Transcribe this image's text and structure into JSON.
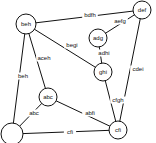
{
  "diagram": {
    "type": "graph",
    "nodes": [
      {
        "id": "beh",
        "label": "beh",
        "x": 26,
        "y": 24,
        "r": 10
      },
      {
        "id": "def",
        "label": "def",
        "x": 142,
        "y": 10,
        "r": 9
      },
      {
        "id": "adg",
        "label": "adg",
        "x": 98,
        "y": 38,
        "r": 9
      },
      {
        "id": "ghi",
        "label": "ghi",
        "x": 103,
        "y": 72,
        "r": 9
      },
      {
        "id": "abc",
        "label": "abc",
        "x": 48,
        "y": 97,
        "r": 9
      },
      {
        "id": "cfi",
        "label": "cfi",
        "x": 118,
        "y": 130,
        "r": 9
      },
      {
        "id": "empty",
        "label": "",
        "x": 12,
        "y": 134,
        "r": 11
      }
    ],
    "edges": [
      {
        "from": "beh",
        "to": "def",
        "label": "bdfh",
        "lx": 90,
        "ly": 15
      },
      {
        "from": "adg",
        "to": "def",
        "label": "aefg",
        "lx": 120,
        "ly": 21
      },
      {
        "from": "beh",
        "to": "ghi",
        "label": "begi",
        "lx": 72,
        "ly": 45
      },
      {
        "from": "adg",
        "to": "ghi",
        "label": "adhi",
        "lx": 104,
        "ly": 53
      },
      {
        "from": "def",
        "to": "cfi",
        "label": "cdei",
        "lx": 138,
        "ly": 69
      },
      {
        "from": "ghi",
        "to": "cfi",
        "label": "cfgh",
        "lx": 118,
        "ly": 100
      },
      {
        "from": "beh",
        "to": "abc",
        "label": "aceh",
        "lx": 44,
        "ly": 58
      },
      {
        "from": "beh",
        "to": "empty",
        "label": "beh",
        "lx": 23,
        "ly": 76
      },
      {
        "from": "abc",
        "to": "empty",
        "label": "abc",
        "lx": 34,
        "ly": 113
      },
      {
        "from": "abc",
        "to": "cfi",
        "label": "abfi",
        "lx": 90,
        "ly": 113
      },
      {
        "from": "empty",
        "to": "cfi",
        "label": "cfi",
        "lx": 70,
        "ly": 132
      }
    ]
  }
}
